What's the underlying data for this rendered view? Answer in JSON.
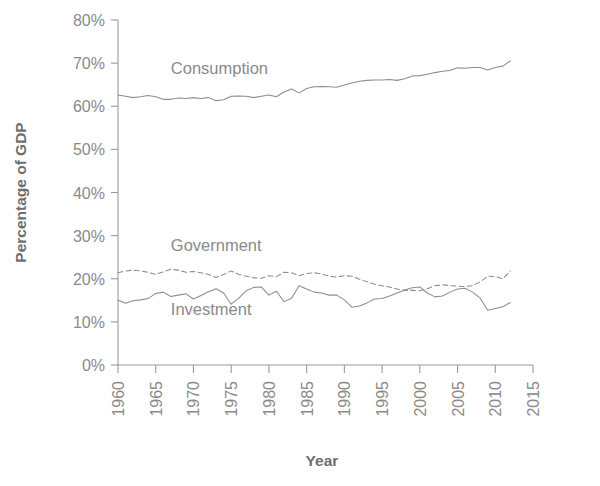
{
  "chart_data": {
    "type": "line",
    "title": "",
    "xlabel": "Year",
    "ylabel": "Percentage of GDP",
    "xlim": [
      1960,
      2015
    ],
    "ylim": [
      0,
      80
    ],
    "grid": false,
    "legend_position": "inline-annotations",
    "x_tick_labels": [
      "1960",
      "1965",
      "1970",
      "1975",
      "1980",
      "1985",
      "1990",
      "1995",
      "2000",
      "2005",
      "2010",
      "2015"
    ],
    "x_ticks": [
      1960,
      1965,
      1970,
      1975,
      1980,
      1985,
      1990,
      1995,
      2000,
      2005,
      2010,
      2015
    ],
    "y_tick_labels": [
      "0%",
      "10%",
      "20%",
      "30%",
      "40%",
      "50%",
      "60%",
      "70%",
      "80%"
    ],
    "y_ticks": [
      0,
      10,
      20,
      30,
      40,
      50,
      60,
      70,
      80
    ],
    "y_unit": "%",
    "annotations": [
      {
        "text": "Consumption",
        "x": 1967,
        "y": 67.5
      },
      {
        "text": "Government",
        "x": 1967,
        "y": 26.5
      },
      {
        "text": "Investment",
        "x": 1967,
        "y": 11.5
      }
    ],
    "x": [
      1960,
      1961,
      1962,
      1963,
      1964,
      1965,
      1966,
      1967,
      1968,
      1969,
      1970,
      1971,
      1972,
      1973,
      1974,
      1975,
      1976,
      1977,
      1978,
      1979,
      1980,
      1981,
      1982,
      1983,
      1984,
      1985,
      1986,
      1987,
      1988,
      1989,
      1990,
      1991,
      1992,
      1993,
      1994,
      1995,
      1996,
      1997,
      1998,
      1999,
      2000,
      2001,
      2002,
      2003,
      2004,
      2005,
      2006,
      2007,
      2008,
      2009,
      2010,
      2011,
      2012
    ],
    "series": [
      {
        "name": "Consumption",
        "style": "solid",
        "color": "#8d8d8d",
        "values": [
          62.6,
          62.3,
          62.0,
          62.2,
          62.5,
          62.2,
          61.6,
          61.6,
          61.9,
          61.8,
          62.0,
          61.8,
          62.0,
          61.3,
          61.5,
          62.3,
          62.4,
          62.3,
          62.0,
          62.3,
          62.6,
          62.2,
          63.3,
          64.0,
          63.1,
          64.1,
          64.5,
          64.6,
          64.5,
          64.4,
          64.9,
          65.4,
          65.8,
          66.0,
          66.1,
          66.1,
          66.2,
          66.0,
          66.4,
          67.0,
          67.1,
          67.4,
          67.8,
          68.1,
          68.3,
          68.9,
          68.8,
          69.0,
          69.0,
          68.4,
          69.0,
          69.3,
          70.5
        ]
      },
      {
        "name": "Government",
        "style": "dashed",
        "color": "#8d8d8d",
        "values": [
          21.4,
          21.8,
          22.0,
          21.8,
          21.5,
          21.0,
          21.6,
          22.2,
          22.0,
          21.5,
          21.7,
          21.4,
          21.0,
          20.3,
          21.0,
          21.8,
          21.0,
          20.6,
          20.2,
          20.1,
          20.7,
          20.5,
          21.5,
          21.4,
          20.7,
          21.2,
          21.4,
          21.1,
          20.6,
          20.4,
          20.7,
          20.6,
          19.9,
          19.3,
          18.7,
          18.4,
          18.1,
          17.6,
          17.3,
          17.3,
          17.2,
          17.7,
          18.4,
          18.6,
          18.4,
          18.3,
          18.2,
          18.4,
          19.3,
          20.6,
          20.5,
          20.0,
          21.8
        ]
      },
      {
        "name": "Investment",
        "style": "solid",
        "color": "#8d8d8d",
        "values": [
          15.0,
          14.3,
          14.9,
          15.1,
          15.4,
          16.6,
          16.9,
          15.9,
          16.2,
          16.5,
          15.3,
          16.1,
          17.0,
          17.7,
          16.7,
          14.1,
          15.5,
          17.2,
          18.0,
          18.1,
          16.2,
          17.1,
          14.7,
          15.5,
          18.4,
          17.6,
          16.9,
          16.7,
          16.2,
          16.2,
          15.1,
          13.4,
          13.7,
          14.4,
          15.3,
          15.4,
          16.0,
          16.7,
          17.4,
          17.9,
          18.1,
          16.7,
          15.8,
          16.0,
          16.9,
          17.6,
          17.8,
          16.9,
          15.5,
          12.7,
          13.1,
          13.5,
          14.5
        ]
      }
    ]
  },
  "figure": {
    "axis_color": "#9a9a9a",
    "text_color": "#8a8a8a",
    "title_color": "#6e6e6e",
    "background": "#ffffff"
  }
}
